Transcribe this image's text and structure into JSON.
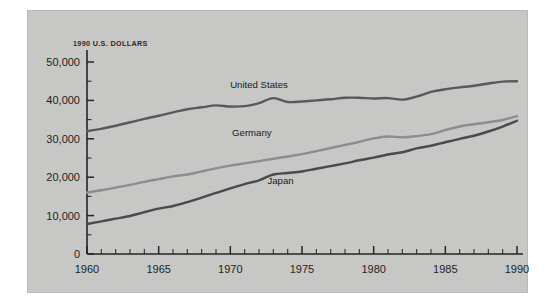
{
  "figure": {
    "background_color": "#c9c9c7",
    "page_color": "#ffffff",
    "axis_title": "1990 U.S. DOLLARS"
  },
  "axes": {
    "x_tick_labels": [
      "1960",
      "1965",
      "1970",
      "1975",
      "1980",
      "1985",
      "1990"
    ],
    "y_tick_labels": [
      "0",
      "10,000",
      "20,000",
      "30,000",
      "40,000",
      "50,000"
    ]
  },
  "labels": {
    "united_states": "United States",
    "germany": "Germany",
    "japan": "Japan"
  },
  "chart_data": {
    "type": "line",
    "title": "",
    "subtitle": "",
    "xlabel": "",
    "ylabel": "1990 U.S. DOLLARS",
    "xlim": [
      1960,
      1990
    ],
    "ylim": [
      0,
      50000
    ],
    "x_major_ticks": [
      1960,
      1965,
      1970,
      1975,
      1980,
      1985,
      1990
    ],
    "x_minor_tick_interval": 1,
    "y_major_ticks": [
      0,
      10000,
      20000,
      30000,
      40000,
      50000
    ],
    "y_minor_tick_interval": 5000,
    "grid": false,
    "legend": "inline-labels",
    "legend_position": "on-plot",
    "x": [
      1960,
      1961,
      1962,
      1963,
      1964,
      1965,
      1966,
      1967,
      1968,
      1969,
      1970,
      1971,
      1972,
      1973,
      1974,
      1975,
      1976,
      1977,
      1978,
      1979,
      1980,
      1981,
      1982,
      1983,
      1984,
      1985,
      1986,
      1987,
      1988,
      1989,
      1990
    ],
    "series": [
      {
        "name": "United States",
        "color": "#595959",
        "values": [
          32000,
          32600,
          33400,
          34300,
          35200,
          36000,
          36900,
          37700,
          38200,
          38700,
          38400,
          38500,
          39300,
          40600,
          39600,
          39700,
          40000,
          40300,
          40700,
          40700,
          40500,
          40600,
          40200,
          41000,
          42200,
          42900,
          43400,
          43800,
          44400,
          44900,
          45000
        ]
      },
      {
        "name": "Germany",
        "color": "#8e8e8e",
        "values": [
          16000,
          16600,
          17300,
          18000,
          18800,
          19500,
          20200,
          20700,
          21500,
          22300,
          23000,
          23600,
          24200,
          24800,
          25400,
          26000,
          26800,
          27600,
          28400,
          29200,
          30100,
          30600,
          30400,
          30700,
          31200,
          32300,
          33200,
          33800,
          34300,
          34900,
          35900
        ]
      },
      {
        "name": "Japan",
        "color": "#4a4a4a",
        "values": [
          7800,
          8500,
          9200,
          9900,
          10900,
          11800,
          12500,
          13500,
          14700,
          15900,
          17100,
          18200,
          19200,
          20700,
          21100,
          21500,
          22200,
          22900,
          23600,
          24400,
          25100,
          25900,
          26500,
          27500,
          28200,
          29100,
          30000,
          30800,
          31900,
          33200,
          34700
        ]
      }
    ],
    "series_inline_label_positions": [
      {
        "name": "United States",
        "x": 1972,
        "y": 43300
      },
      {
        "name": "Germany",
        "x": 1971.5,
        "y": 30600
      },
      {
        "name": "Japan",
        "x": 1973.5,
        "y": 18300
      }
    ]
  }
}
